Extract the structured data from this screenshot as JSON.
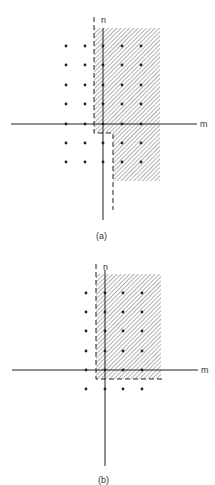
{
  "figures": [
    {
      "id": "a",
      "caption": "(a)",
      "x_axis_label": "m",
      "y_axis_label": "n",
      "lattice_points": {
        "columns_m": [
          -2,
          -1,
          0,
          1,
          2
        ],
        "rows_n": [
          4,
          3,
          2,
          1,
          0,
          -1,
          -2
        ],
        "description": "5x7 grid of dots; region shaded for m>=0, n>=0 plus m>=1 for n<0"
      },
      "shaded_region": "hatched quadrant-like region with step at n=0 between m=0 and m=1"
    },
    {
      "id": "b",
      "caption": "(b)",
      "x_axis_label": "m",
      "y_axis_label": "n",
      "lattice_points": {
        "columns_m": [
          -1,
          0,
          1,
          2
        ],
        "rows_n": [
          4,
          3,
          2,
          1,
          0,
          -1
        ],
        "description": "4x6 grid of dots; region shaded for m>=0, n>=0"
      },
      "shaded_region": "hatched first quadrant with dashed boundary"
    }
  ],
  "colors": {
    "ink": "#222222",
    "hatch": "#555555",
    "background": "#ffffff"
  }
}
